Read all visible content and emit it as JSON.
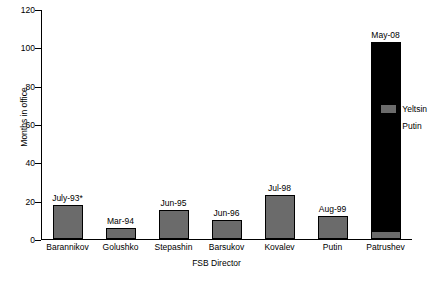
{
  "chart_data": {
    "type": "bar",
    "title": "",
    "xlabel": "FSB Director",
    "ylabel": "Months in office",
    "ylim": [
      0,
      120
    ],
    "yticks": [
      0,
      20,
      40,
      60,
      80,
      100,
      120
    ],
    "grid": false,
    "legend_position": "right",
    "stacked": true,
    "categories": [
      "Barannikov",
      "Golushko",
      "Stepashin",
      "Barsukov",
      "Kovalev",
      "Putin",
      "Patrushev"
    ],
    "series": [
      {
        "name": "Yeltsin",
        "color": "#6b6b6b",
        "values": [
          18,
          6,
          15,
          10,
          23,
          12,
          3
        ]
      },
      {
        "name": "Putin",
        "color": "#000000",
        "values": [
          0,
          0,
          0,
          0,
          0,
          0,
          100
        ]
      }
    ],
    "totals": [
      18,
      6,
      15,
      10,
      23,
      12,
      103
    ],
    "annotations": [
      "July-93*",
      "Mar-94",
      "Jun-95",
      "Jun-96",
      "Jul-98",
      "Aug-99",
      "May-08"
    ]
  },
  "legend": {
    "items": [
      {
        "label": "Yeltsin",
        "color": "#6b6b6b"
      },
      {
        "label": "Putin",
        "color": "#000000"
      }
    ]
  }
}
